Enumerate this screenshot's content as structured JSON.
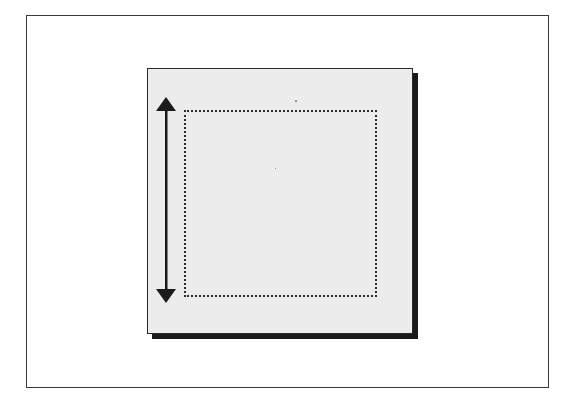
{
  "diagram": {
    "outer_frame": {
      "x": 26,
      "y": 15,
      "width": 523,
      "height": 373
    },
    "panel": {
      "x": 147,
      "y": 68,
      "width": 266,
      "height": 266,
      "fill": "#ececec",
      "shadow_color": "#1a1a1a",
      "shadow_offset": 5
    },
    "dotted_rect": {
      "x": 184,
      "y": 110,
      "width": 193,
      "height": 187,
      "style": "dotted"
    },
    "arrow": {
      "type": "double-headed-vertical",
      "x": 166,
      "y_top": 97,
      "y_bottom": 303,
      "color": "#1a1a1a"
    },
    "colors": {
      "background": "#ffffff",
      "frame": "#3a3a3a",
      "ink": "#1a1a1a"
    }
  }
}
